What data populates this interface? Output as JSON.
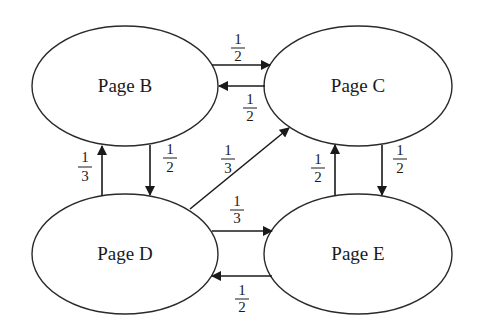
{
  "diagram": {
    "type": "directed-graph",
    "colors": {
      "stroke": "#1a1a1a",
      "background": "#ffffff"
    },
    "nodes": [
      {
        "id": "B",
        "label": "Page B",
        "cx": 125,
        "cy": 86,
        "rx": 93,
        "ry": 60
      },
      {
        "id": "C",
        "label": "Page C",
        "cx": 358,
        "cy": 86,
        "rx": 94,
        "ry": 60
      },
      {
        "id": "D",
        "label": "Page D",
        "cx": 125,
        "cy": 254,
        "rx": 93,
        "ry": 60
      },
      {
        "id": "E",
        "label": "Page E",
        "cx": 358,
        "cy": 254,
        "rx": 94,
        "ry": 60
      }
    ],
    "edges": [
      {
        "from": "B",
        "to": "C",
        "num": "1",
        "den": "2"
      },
      {
        "from": "C",
        "to": "B",
        "num": "1",
        "den": "2"
      },
      {
        "from": "D",
        "to": "B",
        "num": "1",
        "den": "3"
      },
      {
        "from": "B",
        "to": "D",
        "num": "1",
        "den": "2"
      },
      {
        "from": "D",
        "to": "C",
        "num": "1",
        "den": "3"
      },
      {
        "from": "D",
        "to": "E",
        "num": "1",
        "den": "3"
      },
      {
        "from": "E",
        "to": "D",
        "num": "1",
        "den": "2"
      },
      {
        "from": "E",
        "to": "C",
        "num": "1",
        "den": "2"
      },
      {
        "from": "C",
        "to": "E",
        "num": "1",
        "den": "2"
      }
    ]
  }
}
